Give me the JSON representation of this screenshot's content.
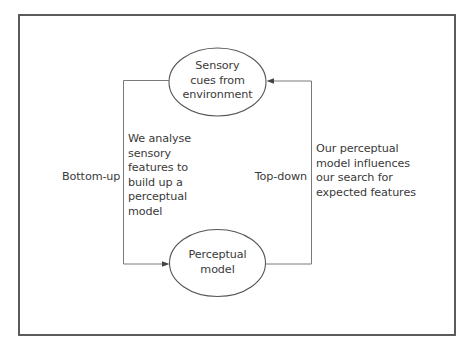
{
  "diagram": {
    "type": "feedback-loop",
    "nodes": {
      "top": {
        "label": "Sensory\ncues from\nenvironment",
        "shape": "ellipse"
      },
      "bottom": {
        "label": "Perceptual\nmodel",
        "shape": "ellipse"
      }
    },
    "edges": [
      {
        "from": "top",
        "to": "bottom",
        "side": "left",
        "label": "Bottom-up",
        "description": "We analyse\nsensory\nfeatures to\nbuild up a\nperceptual\nmodel"
      },
      {
        "from": "bottom",
        "to": "top",
        "side": "right",
        "label": "Top-down",
        "description": "Our perceptual\nmodel influences\nour search for\nexpected features"
      }
    ],
    "colors": {
      "frame": "#4a4a4a",
      "line": "#7a7a7a",
      "text": "#3a3a3a"
    }
  }
}
